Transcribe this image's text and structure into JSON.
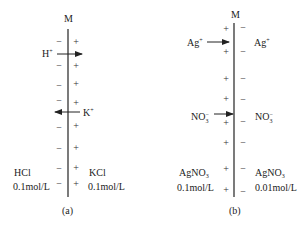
{
  "diagrams": [
    {
      "id": "a",
      "membrane_label": "M",
      "caption": "(a)",
      "left_signs": [
        "−",
        "−",
        "−",
        "−",
        "−",
        "−",
        "−",
        "−"
      ],
      "right_signs": [
        "+",
        "+",
        "+",
        "+",
        "+",
        "+",
        "+",
        "+"
      ],
      "ions": [
        {
          "label": "H",
          "charge": "+",
          "direction": "left-to-right"
        },
        {
          "label": "K",
          "charge": "+",
          "direction": "right-to-left"
        }
      ],
      "left_solution": {
        "name": "HCl",
        "concentration": "0.1mol/L"
      },
      "right_solution": {
        "name": "KCl",
        "concentration": "0.1mol/L"
      }
    },
    {
      "id": "b",
      "membrane_label": "M",
      "caption": "(b)",
      "left_signs": [
        "+",
        "+",
        "+",
        "+",
        "+",
        "+",
        "+",
        "+"
      ],
      "right_signs": [
        "−",
        "−",
        "−",
        "−",
        "−",
        "−",
        "−",
        "−"
      ],
      "ions": [
        {
          "label": "Ag",
          "charge": "+",
          "direction": "left-to-right",
          "left_label": "Ag",
          "right_label": "Ag"
        },
        {
          "label": "NO",
          "subscript": "3",
          "charge": "−",
          "direction": "left-to-right",
          "left_label": "NO",
          "right_label": "NO"
        }
      ],
      "left_solution": {
        "name": "AgNO",
        "subscript": "3",
        "concentration": "0.1mol/L"
      },
      "right_solution": {
        "name": "AgNO",
        "subscript": "3",
        "concentration": "0.01mol/L"
      }
    }
  ]
}
